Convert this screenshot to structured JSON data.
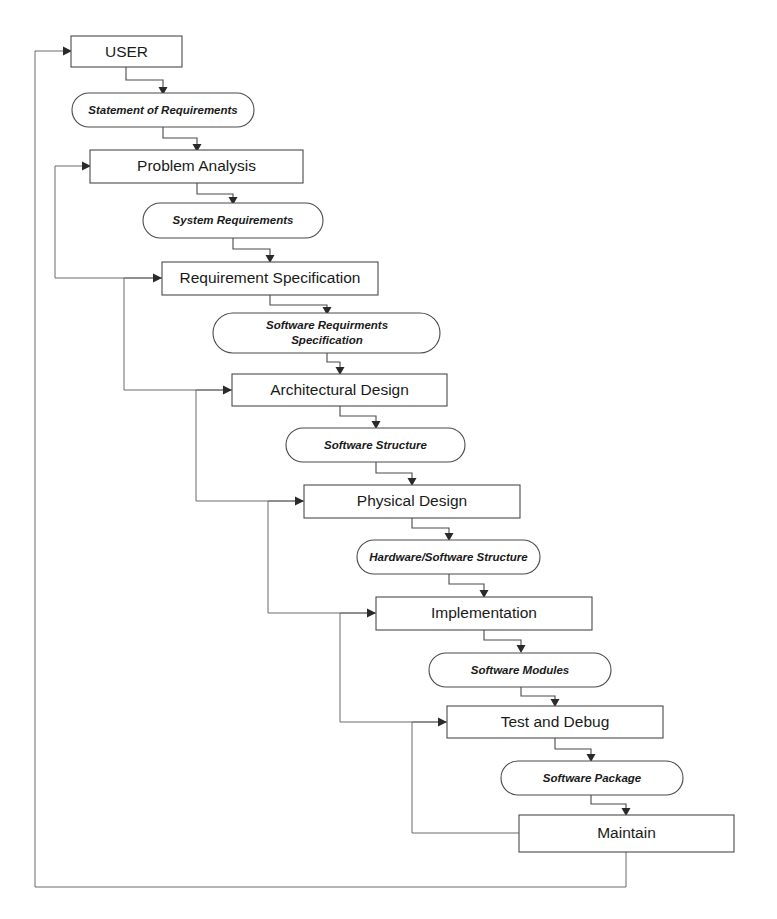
{
  "diagram": {
    "type": "flowchart",
    "colors": {
      "box_stroke": "#4a4a4a",
      "box_fill": "#ffffff",
      "text": "#1a1a1a",
      "line": "#4a4a4a",
      "feedback_line": "#6a6a6a",
      "background": "#ffffff"
    },
    "stages": [
      {
        "id": "user",
        "label": "USER"
      },
      {
        "id": "problem-analysis",
        "label": "Problem Analysis"
      },
      {
        "id": "requirement-specification",
        "label": "Requirement Specification"
      },
      {
        "id": "architectural-design",
        "label": "Architectural Design"
      },
      {
        "id": "physical-design",
        "label": "Physical Design"
      },
      {
        "id": "implementation",
        "label": "Implementation"
      },
      {
        "id": "test-and-debug",
        "label": "Test and Debug"
      },
      {
        "id": "maintain",
        "label": "Maintain"
      }
    ],
    "artifacts": [
      {
        "id": "statement-of-requirements",
        "label": "Statement of Requirements"
      },
      {
        "id": "system-requirements",
        "label": "System Requirements"
      },
      {
        "id": "software-requirments-specification",
        "line1": "Software Requirments",
        "line2": "Specification"
      },
      {
        "id": "software-structure",
        "label": "Software Structure"
      },
      {
        "id": "hardware-software-structure",
        "label": "Hardware/Software Structure"
      },
      {
        "id": "software-modules",
        "label": "Software Modules"
      },
      {
        "id": "software-package",
        "label": "Software Package"
      }
    ],
    "flow": [
      {
        "from": "user",
        "to": "statement-of-requirements"
      },
      {
        "from": "statement-of-requirements",
        "to": "problem-analysis"
      },
      {
        "from": "problem-analysis",
        "to": "system-requirements"
      },
      {
        "from": "system-requirements",
        "to": "requirement-specification"
      },
      {
        "from": "requirement-specification",
        "to": "software-requirments-specification"
      },
      {
        "from": "software-requirments-specification",
        "to": "architectural-design"
      },
      {
        "from": "architectural-design",
        "to": "software-structure"
      },
      {
        "from": "software-structure",
        "to": "physical-design"
      },
      {
        "from": "physical-design",
        "to": "hardware-software-structure"
      },
      {
        "from": "hardware-software-structure",
        "to": "implementation"
      },
      {
        "from": "implementation",
        "to": "software-modules"
      },
      {
        "from": "software-modules",
        "to": "test-and-debug"
      },
      {
        "from": "test-and-debug",
        "to": "software-package"
      },
      {
        "from": "software-package",
        "to": "maintain"
      }
    ],
    "feedback": [
      {
        "id": "feedback-requirement-spec-to-problem-analysis",
        "from": "requirement-specification",
        "to": "problem-analysis"
      },
      {
        "id": "feedback-architectural-design-to-requirement-spec",
        "from": "architectural-design",
        "to": "requirement-specification"
      },
      {
        "id": "feedback-physical-design-to-architectural-design",
        "from": "physical-design",
        "to": "architectural-design"
      },
      {
        "id": "feedback-implementation-to-physical-design",
        "from": "implementation",
        "to": "physical-design"
      },
      {
        "id": "feedback-test-debug-to-implementation",
        "from": "test-and-debug",
        "to": "implementation"
      },
      {
        "id": "feedback-maintain-to-test-debug",
        "from": "maintain",
        "to": "test-and-debug"
      },
      {
        "id": "feedback-maintain-to-user",
        "from": "maintain",
        "to": "user"
      }
    ]
  }
}
